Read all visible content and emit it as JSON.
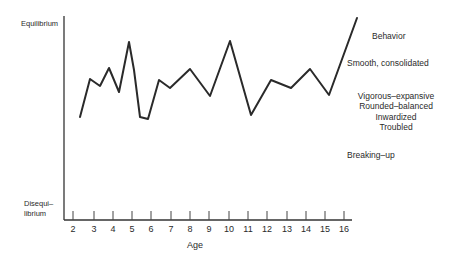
{
  "chart_data": {
    "type": "line",
    "title": "",
    "xlabel": "Age",
    "ylabel_top": "Equilibrium",
    "ylabel_bottom": "Disequi–\nlibrium",
    "categories": [
      2,
      2.5,
      3,
      3.5,
      4,
      4.5,
      5,
      5.5,
      6,
      6.5,
      7,
      8,
      9,
      10,
      11,
      12,
      13,
      14,
      15,
      16.3
    ],
    "x_ticks": [
      "2",
      "3",
      "4",
      "5",
      "6",
      "7",
      "8",
      "9",
      "10",
      "11",
      "12",
      "13",
      "14",
      "15",
      "16"
    ],
    "points_px": [
      [
        80,
        117
      ],
      [
        90,
        79
      ],
      [
        100,
        86
      ],
      [
        109,
        68
      ],
      [
        119,
        92
      ],
      [
        129,
        42
      ],
      [
        134,
        70
      ],
      [
        140,
        117
      ],
      [
        148,
        119
      ],
      [
        159,
        80
      ],
      [
        170,
        88
      ],
      [
        190,
        69
      ],
      [
        210,
        96
      ],
      [
        230,
        41
      ],
      [
        251,
        115
      ],
      [
        271,
        80
      ],
      [
        291,
        88
      ],
      [
        310,
        69
      ],
      [
        329,
        95
      ],
      [
        357,
        18
      ]
    ],
    "legend_title": "Behavior",
    "legend": [
      "Smooth, consolidated",
      "Vigorous–expansive",
      "Rounded–balanced",
      "Inwardized",
      "Troubled",
      "Breaking–up"
    ],
    "grid": false
  },
  "labels": {
    "equilibrium": "Equilibrium",
    "disequi_line1": "Disequi–",
    "disequi_line2": "librium",
    "age": "Age",
    "behavior": "Behavior",
    "smooth": "Smooth, consolidated",
    "vigorous": "Vigorous–expansive",
    "rounded": "Rounded–balanced",
    "inwardized": "Inwardized",
    "troubled": "Troubled",
    "breaking": "Breaking–up"
  },
  "ticks": [
    "2",
    "3",
    "4",
    "5",
    "6",
    "7",
    "8",
    "9",
    "10",
    "11",
    "12",
    "13",
    "14",
    "15",
    "16"
  ]
}
